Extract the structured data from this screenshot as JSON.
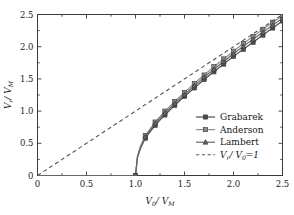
{
  "chart_data": {
    "type": "line",
    "title": "",
    "xlabel": "V0/VM",
    "ylabel": "Vr/VM",
    "xlabel_parts": {
      "v": "V",
      "sub1": "0",
      "slash": "/",
      "v2": "V",
      "sub2": "M"
    },
    "ylabel_parts": {
      "v": "V",
      "sub1": "r",
      "slash": "/",
      "v2": "V",
      "sub2": "M"
    },
    "xlim": [
      0,
      2.5
    ],
    "ylim": [
      0,
      2.5
    ],
    "xticks": [
      0,
      0.5,
      1.0,
      1.5,
      2.0,
      2.5
    ],
    "yticks": [
      0,
      0.5,
      1.0,
      1.5,
      2.0,
      2.5
    ],
    "xticklabels": [
      "0",
      "0.5",
      "1.0",
      "1.5",
      "2.0",
      "2.5"
    ],
    "yticklabels": [
      "0",
      "0.5",
      "1.0",
      "1.5",
      "2.0",
      "2.5"
    ],
    "grid": false,
    "legend_position": "lower-right-inside",
    "series": [
      {
        "name": "Grabarek",
        "marker": "square",
        "color": "#4d4d4d",
        "linestyle": "solid",
        "x": [
          0.0,
          0.2,
          0.4,
          0.6,
          0.8,
          0.95,
          1.0,
          1.02,
          1.05,
          1.1,
          1.2,
          1.3,
          1.4,
          1.5,
          1.6,
          1.7,
          1.8,
          1.9,
          2.0,
          2.1,
          2.2,
          2.3,
          2.4,
          2.5
        ],
        "y": [
          0.0,
          0.0,
          0.0,
          0.0,
          0.0,
          0.0,
          0.0,
          0.28,
          0.42,
          0.58,
          0.78,
          0.94,
          1.09,
          1.23,
          1.36,
          1.49,
          1.61,
          1.73,
          1.85,
          1.96,
          2.07,
          2.18,
          2.29,
          2.4
        ],
        "marker_x": [
          1.0,
          1.1,
          1.2,
          1.3,
          1.4,
          1.5,
          1.6,
          1.7,
          1.8,
          1.9,
          2.0,
          2.1,
          2.2,
          2.3,
          2.4,
          2.5
        ],
        "marker_y": [
          0.0,
          0.58,
          0.78,
          0.94,
          1.09,
          1.23,
          1.36,
          1.49,
          1.61,
          1.73,
          1.85,
          1.96,
          2.07,
          2.18,
          2.29,
          2.4
        ]
      },
      {
        "name": "Anderson",
        "marker": "square",
        "color": "#8c8c8c",
        "linestyle": "solid",
        "x": [
          0.0,
          0.2,
          0.4,
          0.6,
          0.8,
          0.95,
          1.0,
          1.02,
          1.05,
          1.1,
          1.2,
          1.3,
          1.4,
          1.5,
          1.6,
          1.7,
          1.8,
          1.9,
          2.0,
          2.1,
          2.2,
          2.3,
          2.4,
          2.5
        ],
        "y": [
          0.0,
          0.0,
          0.0,
          0.0,
          0.0,
          0.0,
          0.0,
          0.3,
          0.45,
          0.62,
          0.83,
          1.0,
          1.15,
          1.29,
          1.43,
          1.56,
          1.69,
          1.81,
          1.93,
          2.05,
          2.16,
          2.27,
          2.38,
          2.48
        ],
        "marker_x": [
          1.0,
          1.1,
          1.2,
          1.3,
          1.4,
          1.5,
          1.6,
          1.7,
          1.8,
          1.9,
          2.0,
          2.1,
          2.2,
          2.3,
          2.4,
          2.5
        ],
        "marker_y": [
          0.0,
          0.62,
          0.83,
          1.0,
          1.15,
          1.29,
          1.43,
          1.56,
          1.69,
          1.81,
          1.93,
          2.05,
          2.16,
          2.27,
          2.38,
          2.48
        ]
      },
      {
        "name": "Lambert",
        "marker": "triangle",
        "color": "#666666",
        "linestyle": "solid",
        "x": [
          0.0,
          0.2,
          0.4,
          0.6,
          0.8,
          0.95,
          1.0,
          1.02,
          1.05,
          1.1,
          1.2,
          1.3,
          1.4,
          1.5,
          1.6,
          1.7,
          1.8,
          1.9,
          2.0,
          2.1,
          2.2,
          2.3,
          2.4,
          2.5
        ],
        "y": [
          0.0,
          0.0,
          0.0,
          0.0,
          0.0,
          0.0,
          0.0,
          0.29,
          0.435,
          0.6,
          0.805,
          0.97,
          1.12,
          1.26,
          1.395,
          1.525,
          1.65,
          1.77,
          1.89,
          2.005,
          2.115,
          2.225,
          2.335,
          2.44
        ],
        "marker_x": [
          1.0,
          1.1,
          1.2,
          1.3,
          1.4,
          1.5,
          1.6,
          1.7,
          1.8,
          1.9,
          2.0,
          2.1,
          2.2,
          2.3,
          2.4,
          2.5
        ],
        "marker_y": [
          0.0,
          0.6,
          0.805,
          0.97,
          1.12,
          1.26,
          1.395,
          1.525,
          1.65,
          1.77,
          1.89,
          2.005,
          2.115,
          2.225,
          2.335,
          2.44
        ]
      },
      {
        "name": "Vr/V0=1",
        "marker": "none",
        "color": "#555555",
        "linestyle": "dashed",
        "x": [
          0.0,
          2.5
        ],
        "y": [
          0.0,
          2.5
        ]
      }
    ],
    "legend": [
      {
        "label": "Grabarek",
        "marker": "square",
        "color": "#4d4d4d",
        "linestyle": "solid"
      },
      {
        "label": "Anderson",
        "marker": "square",
        "color": "#8c8c8c",
        "linestyle": "solid"
      },
      {
        "label": "Lambert",
        "marker": "triangle",
        "color": "#666666",
        "linestyle": "solid"
      },
      {
        "label": "Vr/V0=1",
        "marker": "none",
        "color": "#555555",
        "linestyle": "dashed"
      }
    ],
    "legend_math_parts": {
      "v": "V",
      "sub1": "r",
      "slash": "/",
      "v2": "V",
      "sub2": "0",
      "eq": "=1"
    },
    "colors": {
      "frame": "#3a3a3a",
      "text": "#1a1a1a",
      "background": "#ffffff"
    }
  }
}
